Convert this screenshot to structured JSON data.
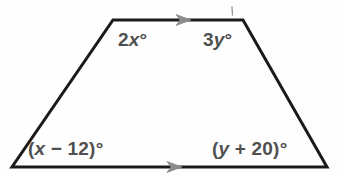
{
  "figure": {
    "name": "trapezoid-angle-diagram",
    "type": "geometry-figure",
    "shape": "trapezoid",
    "background_color": "#fefefe",
    "outline_color": "#1a1a1a",
    "outline_width": 3,
    "marker_color": "#8c8c8c",
    "label_color": "#4f4f4f",
    "width": 346,
    "height": 177,
    "vertices": {
      "top_left": {
        "x": 113,
        "y": 20
      },
      "top_right": {
        "x": 243,
        "y": 20
      },
      "bottom_right": {
        "x": 327,
        "y": 167
      },
      "bottom_left": {
        "x": 12,
        "y": 167
      }
    },
    "parallel_marks": [
      {
        "name": "top-edge-arrow",
        "x": 185,
        "y": 20,
        "direction": "right",
        "ticks": 1
      },
      {
        "name": "bottom-edge-arrow",
        "x": 176,
        "y": 167,
        "direction": "right",
        "ticks": 1
      }
    ],
    "tick_mark": {
      "name": "top-right-tick",
      "x": 232,
      "y": 8,
      "height": 7
    }
  },
  "labels": {
    "top_left": {
      "prefix": "2",
      "variable": "x",
      "suffix": "°",
      "full_text": "2x°"
    },
    "top_right": {
      "prefix": "3",
      "variable": "y",
      "suffix": "°",
      "full_text": "3y°"
    },
    "bottom_left": {
      "prefix": "(",
      "variable": "x",
      "suffix": " − 12)°",
      "full_text": "(x − 12)°"
    },
    "bottom_right": {
      "prefix": "(",
      "variable": "y",
      "suffix": " + 20)°",
      "full_text": "(y + 20)°"
    }
  }
}
